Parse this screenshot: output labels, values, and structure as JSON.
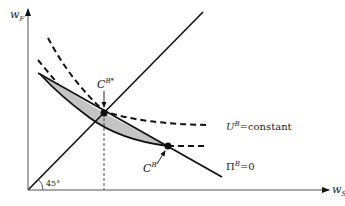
{
  "diagram": {
    "axes": {
      "y_label": {
        "main": "w",
        "sub": "F"
      },
      "x_label": {
        "main": "w",
        "sub": "S"
      },
      "angle_label": "45°"
    },
    "points": {
      "optimal": {
        "main": "C",
        "sup": "B*"
      },
      "other": {
        "main": "C",
        "sup": "B′"
      }
    },
    "curves": {
      "utility": {
        "main": "U",
        "sup": "B",
        "rest": "=constant"
      },
      "profit": {
        "main": "Π",
        "sup": "B",
        "rest": "=0"
      }
    },
    "colors": {
      "line": "#111111",
      "shade": "#c4c4c4",
      "background": "#ffffff"
    }
  }
}
